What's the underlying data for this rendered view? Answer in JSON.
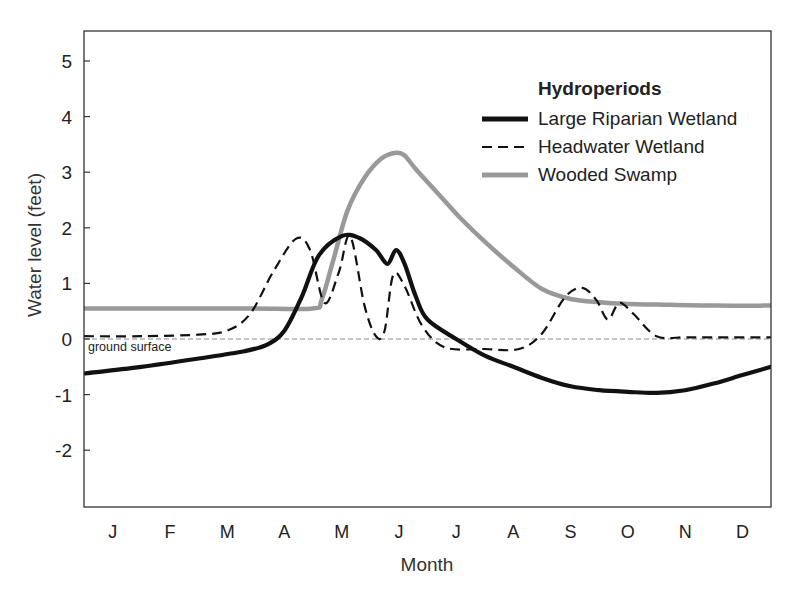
{
  "chart_data": {
    "type": "line",
    "title": "",
    "xlabel": "Month",
    "ylabel": "Water level (feet)",
    "categories": [
      "J",
      "F",
      "M",
      "A",
      "M",
      "J",
      "J",
      "A",
      "S",
      "O",
      "N",
      "D"
    ],
    "xlim": [
      0,
      12
    ],
    "ylim": [
      -3,
      5.5
    ],
    "yticks": [
      5,
      4,
      3,
      2,
      1,
      0,
      -1,
      -2
    ],
    "grid": false,
    "legend_position": "upper right",
    "legend_title": "Hydroperiods",
    "reference_line": {
      "y": 0,
      "label": "ground surface",
      "style": "dashed",
      "color": "#888888"
    },
    "series": [
      {
        "name": "Large Riparian Wetland",
        "style": "solid-thick",
        "color": "#111111",
        "x": [
          0,
          1,
          2,
          2.8,
          3.2,
          3.5,
          3.8,
          4.1,
          4.5,
          4.8,
          5.1,
          5.3,
          5.45,
          5.6,
          5.8,
          6.0,
          6.5,
          7.0,
          7.5,
          8.0,
          8.5,
          9.0,
          9.5,
          10.0,
          10.5,
          11.0,
          11.5,
          12.0
        ],
        "values": [
          -0.62,
          -0.5,
          -0.35,
          -0.22,
          -0.1,
          0.15,
          0.75,
          1.5,
          1.85,
          1.82,
          1.6,
          1.35,
          1.6,
          1.35,
          0.75,
          0.35,
          0.0,
          -0.3,
          -0.5,
          -0.7,
          -0.85,
          -0.92,
          -0.95,
          -0.97,
          -0.92,
          -0.8,
          -0.65,
          -0.5
        ]
      },
      {
        "name": "Headwater Wetland",
        "style": "dashed",
        "color": "#111111",
        "x": [
          0,
          1,
          2,
          2.5,
          2.9,
          3.3,
          3.7,
          3.95,
          4.2,
          4.45,
          4.65,
          4.9,
          5.1,
          5.25,
          5.4,
          5.6,
          5.9,
          6.3,
          7.0,
          7.6,
          8.0,
          8.4,
          8.7,
          8.95,
          9.15,
          9.35,
          9.6,
          10.0,
          10.5,
          11.0,
          12.0
        ],
        "values": [
          0.05,
          0.05,
          0.08,
          0.15,
          0.45,
          1.2,
          1.8,
          1.6,
          0.65,
          1.2,
          1.85,
          0.6,
          0.05,
          0.15,
          1.15,
          0.95,
          0.25,
          -0.15,
          -0.18,
          -0.18,
          0.1,
          0.75,
          0.92,
          0.7,
          0.35,
          0.65,
          0.45,
          0.05,
          0.03,
          0.03,
          0.03
        ]
      },
      {
        "name": "Wooded Swamp",
        "style": "solid-gray",
        "color": "#999999",
        "x": [
          0,
          1,
          2,
          3,
          4.0,
          4.15,
          4.35,
          4.6,
          4.9,
          5.2,
          5.45,
          5.6,
          5.8,
          6.2,
          6.6,
          7.0,
          7.5,
          8.0,
          8.5,
          9.0,
          9.5,
          10.0,
          11.0,
          12.0
        ],
        "values": [
          0.55,
          0.55,
          0.55,
          0.55,
          0.55,
          0.7,
          1.4,
          2.3,
          2.9,
          3.25,
          3.35,
          3.3,
          3.05,
          2.6,
          2.15,
          1.75,
          1.3,
          0.9,
          0.72,
          0.66,
          0.63,
          0.62,
          0.6,
          0.6
        ]
      }
    ]
  }
}
